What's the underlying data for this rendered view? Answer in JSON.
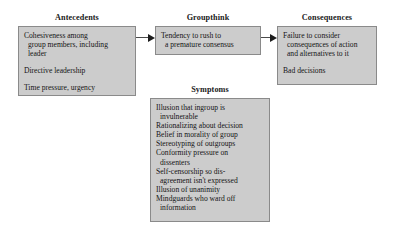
{
  "diagram": {
    "type": "flow-diagram",
    "colors": {
      "box_fill": "#cccccc",
      "box_border": "#8a8a8a",
      "text": "#141414",
      "arrow": "#1d1d1d",
      "background": "#ffffff"
    },
    "nodes": [
      {
        "id": "antecedents",
        "title": "Antecedents",
        "entries": [
          {
            "lines": [
              "Cohesiveness among",
              "group members, including",
              "leader"
            ]
          },
          {
            "lines": [
              "Directive leadership"
            ]
          },
          {
            "lines": [
              "Time pressure, urgency"
            ]
          }
        ]
      },
      {
        "id": "groupthink",
        "title": "Groupthink",
        "entries": [
          {
            "lines": [
              "Tendency to rush to",
              "a premature consensus"
            ]
          }
        ]
      },
      {
        "id": "consequences",
        "title": "Consequences",
        "entries": [
          {
            "lines": [
              "Failure to consider",
              "consequences of action",
              "and alternatives to it"
            ]
          },
          {
            "lines": [
              "Bad decisions"
            ]
          }
        ]
      },
      {
        "id": "symptoms",
        "title": "Symptoms",
        "entries": [
          {
            "lines": [
              "Illusion that ingroup is",
              "invulnerable"
            ]
          },
          {
            "lines": [
              "Rationalizing about decision"
            ]
          },
          {
            "lines": [
              "Belief in morality of group"
            ]
          },
          {
            "lines": [
              "Stereotyping of outgroups"
            ]
          },
          {
            "lines": [
              "Conformity pressure on",
              "dissenters"
            ]
          },
          {
            "lines": [
              "Self-censorship so dis-",
              "agreement isn't expressed"
            ]
          },
          {
            "lines": [
              "Illusion of unanimity"
            ]
          },
          {
            "lines": [
              "Mindguards who ward off",
              "information"
            ]
          }
        ]
      }
    ],
    "arrows": [
      {
        "id": "antecedents-groupthink",
        "from": "antecedents",
        "to": "groupthink",
        "style": "solid-filled-head"
      },
      {
        "id": "groupthink-consequences",
        "from": "groupthink",
        "to": "consequences",
        "style": "solid-filled-head"
      }
    ]
  }
}
